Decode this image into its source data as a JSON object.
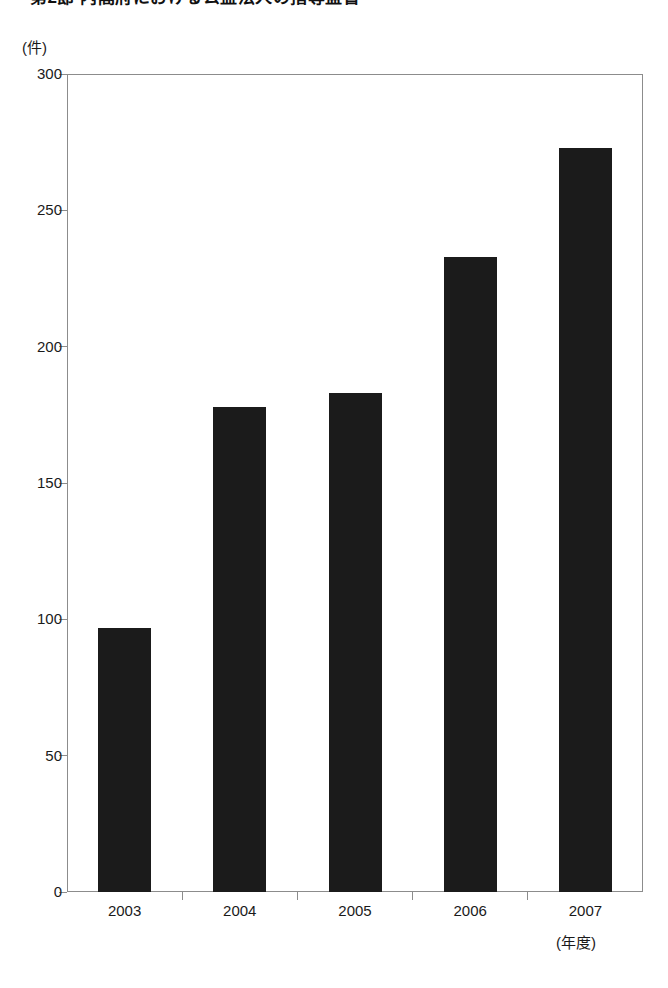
{
  "title": {
    "text": "第2節 内閣府における公益法人の指導監督"
  },
  "axes": {
    "y_unit_label": "(件)",
    "x_unit_label": "(年度)"
  },
  "chart_data": {
    "type": "bar",
    "title": "第2節 内閣府における公益法人の指導監督",
    "xlabel": "(年度)",
    "ylabel": "(件)",
    "categories": [
      "2003",
      "2004",
      "2005",
      "2006",
      "2007"
    ],
    "values": [
      97,
      178,
      183,
      233,
      273
    ],
    "ylim": [
      0,
      300
    ],
    "yticks": [
      0,
      50,
      100,
      150,
      200,
      250,
      300
    ],
    "ytick_labels": [
      "0",
      "50",
      "100",
      "150",
      "200",
      "250",
      "300"
    ],
    "grid": false,
    "legend": false,
    "bar_color": "#1b1b1b",
    "frame_color": "#8c8c8c",
    "background": "#ffffff"
  }
}
